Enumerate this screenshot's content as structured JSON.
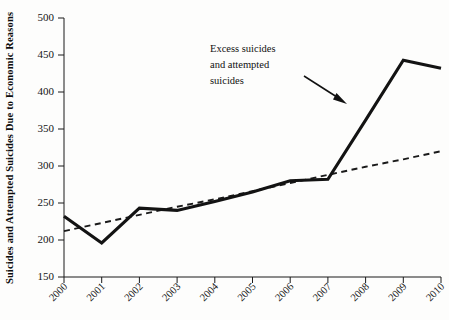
{
  "chart_data": {
    "type": "line",
    "title": "",
    "subtitle": "",
    "xlabel": "",
    "ylabel": "Suicides and Attempted Suicides Due to Economic Reasons",
    "categories": [
      "2000",
      "2001",
      "2002",
      "2003",
      "2004",
      "2005",
      "2006",
      "2007",
      "2008",
      "2009",
      "2010"
    ],
    "x": [
      2000,
      2001,
      2002,
      2003,
      2004,
      2005,
      2006,
      2007,
      2008,
      2009,
      2010
    ],
    "ylim": [
      150,
      500
    ],
    "xlim": [
      2000,
      2010
    ],
    "yticks": [
      150,
      200,
      250,
      300,
      350,
      400,
      450,
      500
    ],
    "ytick_labels": [
      "150",
      "200",
      "250",
      "300",
      "350",
      "400",
      "450",
      "500"
    ],
    "xtick_labels": [
      "2000",
      "2001",
      "2002",
      "2003",
      "2004",
      "2005",
      "2006",
      "2007",
      "2008",
      "2009",
      "2010"
    ],
    "grid": false,
    "legend": "none",
    "series": [
      {
        "name": "Observed suicides and attempted suicides",
        "style": "solid",
        "color": "#131313",
        "values": [
          232,
          196,
          243,
          240,
          252,
          265,
          280,
          282,
          362,
          443,
          432
        ]
      },
      {
        "name": "Pre-crisis trend",
        "style": "dashed",
        "color": "#1a1a1a",
        "values": [
          212,
          223,
          234,
          245,
          255,
          266,
          277,
          288,
          299,
          309,
          320
        ]
      }
    ],
    "annotations": [
      {
        "name": "excess-suicides-note",
        "lines": [
          "Excess suicides",
          "and attempted",
          "suicides"
        ],
        "arrow_from": [
          2007.55,
          406
        ],
        "arrow_to": [
          2008.6,
          371
        ]
      }
    ]
  },
  "axis": {
    "y_title": "Suicides and Attempted Suicides Due to Economic Reasons"
  }
}
